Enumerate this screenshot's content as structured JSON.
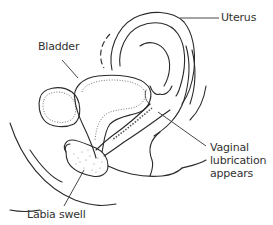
{
  "diagram": {
    "labels": [
      {
        "id": "uterus",
        "text": "Uterus"
      },
      {
        "id": "bladder",
        "text": "Bladder"
      },
      {
        "id": "vaginal_lubrication",
        "text": "Vaginal\nlubrication\nappears"
      },
      {
        "id": "labia",
        "text": "Labia swell"
      }
    ],
    "colors": {
      "line": "#2a2a2a",
      "text": "#333333",
      "background": "#ffffff"
    }
  }
}
